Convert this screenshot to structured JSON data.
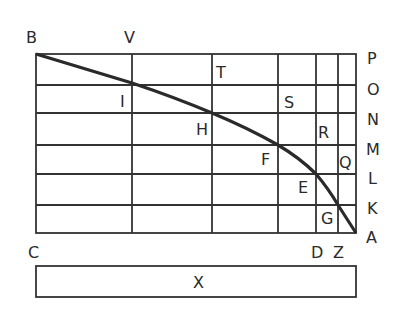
{
  "diagram": {
    "frame": {
      "left": 36,
      "top": 54,
      "right": 356,
      "bottom": 233
    },
    "vertical_lines": [
      36,
      132,
      212,
      278,
      316,
      338,
      356
    ],
    "horizontal_lines": [
      54,
      85,
      113,
      145,
      174,
      205,
      233
    ],
    "curve_points": [
      {
        "name": "B",
        "x": 36,
        "y": 54
      },
      {
        "name": "I",
        "x": 132,
        "y": 83
      },
      {
        "name": "H",
        "x": 212,
        "y": 113
      },
      {
        "name": "F",
        "x": 278,
        "y": 145
      },
      {
        "name": "E",
        "x": 316,
        "y": 174
      },
      {
        "name": "G",
        "x": 338,
        "y": 205
      },
      {
        "name": "A",
        "x": 356,
        "y": 233
      }
    ],
    "labels": {
      "B": "B",
      "V": "V",
      "T": "T",
      "I": "I",
      "H": "H",
      "S": "S",
      "R": "R",
      "F": "F",
      "Q": "Q",
      "E": "E",
      "G": "G",
      "C": "C",
      "D": "D",
      "Z": "Z",
      "P": "P",
      "O": "O",
      "N": "N",
      "M": "M",
      "L": "L",
      "K": "K",
      "A": "A",
      "X": "X"
    },
    "bottom_box": {
      "label": "X",
      "left": 36,
      "top": 266,
      "right": 356,
      "bottom": 297
    }
  }
}
